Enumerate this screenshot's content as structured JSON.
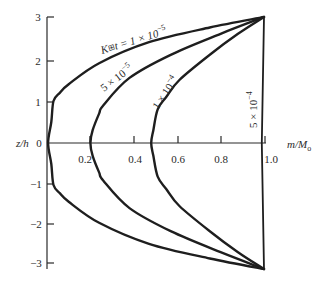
{
  "chart_data": {
    "type": "line",
    "title": "",
    "xlabel": "m/Mₒ",
    "ylabel": "z/h",
    "xlim": [
      0,
      1.0
    ],
    "ylim": [
      -3,
      3
    ],
    "grid": false,
    "legend": "inline curve labels",
    "x_ticks": [
      0.2,
      0.4,
      0.6,
      0.8,
      1.0
    ],
    "x_tick_labels": [
      "0.2",
      "0.4",
      "0.6",
      "0.8",
      "1.0"
    ],
    "y_ticks": [
      3,
      2,
      1,
      0,
      -1,
      -2,
      -3
    ],
    "y_tick_labels": [
      "3",
      "2",
      "1",
      "0",
      "−1",
      "−2",
      "−3"
    ],
    "series": [
      {
        "name": "K⊟t = 1 × 10⁻⁵",
        "label_prefix": "K",
        "label_glyph": "⊞",
        "label_rest": "t = 1 × 10⁻⁵",
        "points": [
          [
            1.0,
            3.0
          ],
          [
            0.75,
            2.75
          ],
          [
            0.47,
            2.4
          ],
          [
            0.24,
            1.9
          ],
          [
            0.1,
            1.4
          ],
          [
            0.06,
            1.2
          ],
          [
            0.03,
            1.0
          ],
          [
            0.02,
            0.5
          ],
          [
            0.005,
            0.0
          ],
          [
            0.02,
            -0.5
          ],
          [
            0.03,
            -1.0
          ],
          [
            0.06,
            -1.2
          ],
          [
            0.1,
            -1.4
          ],
          [
            0.24,
            -1.9
          ],
          [
            0.47,
            -2.4
          ],
          [
            0.75,
            -2.75
          ],
          [
            1.0,
            -3.0
          ]
        ]
      },
      {
        "name": "5 × 10⁻⁵",
        "points": [
          [
            1.0,
            3.0
          ],
          [
            0.8,
            2.6
          ],
          [
            0.57,
            2.1
          ],
          [
            0.38,
            1.55
          ],
          [
            0.26,
            0.9
          ],
          [
            0.24,
            0.7
          ],
          [
            0.21,
            0.3
          ],
          [
            0.2,
            0.0
          ],
          [
            0.21,
            -0.3
          ],
          [
            0.24,
            -0.7
          ],
          [
            0.26,
            -0.9
          ],
          [
            0.38,
            -1.55
          ],
          [
            0.57,
            -2.1
          ],
          [
            0.8,
            -2.6
          ],
          [
            1.0,
            -3.0
          ]
        ]
      },
      {
        "name": "1 × 10⁻⁴",
        "points": [
          [
            1.0,
            3.0
          ],
          [
            0.88,
            2.6
          ],
          [
            0.75,
            2.1
          ],
          [
            0.61,
            1.5
          ],
          [
            0.55,
            1.1
          ],
          [
            0.51,
            0.8
          ],
          [
            0.49,
            0.3
          ],
          [
            0.48,
            0.0
          ],
          [
            0.49,
            -0.3
          ],
          [
            0.51,
            -0.8
          ],
          [
            0.55,
            -1.1
          ],
          [
            0.61,
            -1.5
          ],
          [
            0.75,
            -2.1
          ],
          [
            0.88,
            -2.6
          ],
          [
            1.0,
            -3.0
          ]
        ]
      },
      {
        "name": "5 × 10⁻⁴",
        "points": [
          [
            1.0,
            3.0
          ],
          [
            0.99,
            0.0
          ],
          [
            1.0,
            -3.0
          ]
        ]
      }
    ]
  },
  "labels": {
    "xlabel": "m/M",
    "xlabel_sub": "o",
    "ylabel": "z/h",
    "curve1_k": "K",
    "curve1_glyph": "⊞",
    "curve1_rest": "t = 1 × 10",
    "curve1_exp": "−5",
    "curve2_base": "5 × 10",
    "curve2_exp": "−5",
    "curve3_base": "1 × 10",
    "curve3_exp": "−4",
    "curve4_base": "5 × 10",
    "curve4_exp": "−4",
    "x_ticks": [
      "0.2",
      "0.4",
      "0.6",
      "0.8",
      "1.0"
    ],
    "y_ticks": [
      "3",
      "2",
      "1",
      "0",
      "−1",
      "−2",
      "−3"
    ]
  }
}
